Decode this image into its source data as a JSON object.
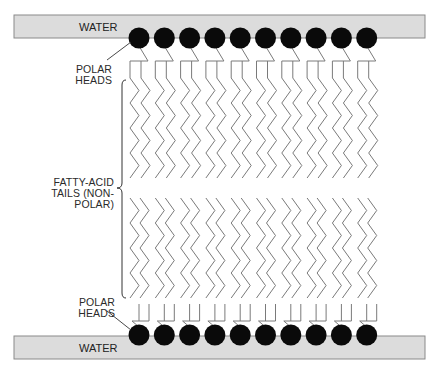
{
  "labels": {
    "water_top": "WATER",
    "water_bottom": "WATER",
    "polar_heads_top_line1": "POLAR",
    "polar_heads_top_line2": "HEADS",
    "polar_heads_bottom_line1": "POLAR",
    "polar_heads_bottom_line2": "HEADS",
    "tails_line1": "FATTY-ACID",
    "tails_line2": "TAILS (NON-",
    "tails_line3": "POLAR)"
  },
  "colors": {
    "water_fill": "#dcdcdc",
    "water_stroke": "#8a8a8a",
    "head_fill": "#0a0a0a",
    "tail_stroke": "#7a7a7a",
    "text": "#2a2a2a"
  },
  "layout": {
    "molecule_count_per_layer": 10,
    "head_start_x": 139,
    "head_spacing": 25.3,
    "head_radius": 10.5,
    "top_head_y": 38,
    "bottom_head_y": 335
  }
}
